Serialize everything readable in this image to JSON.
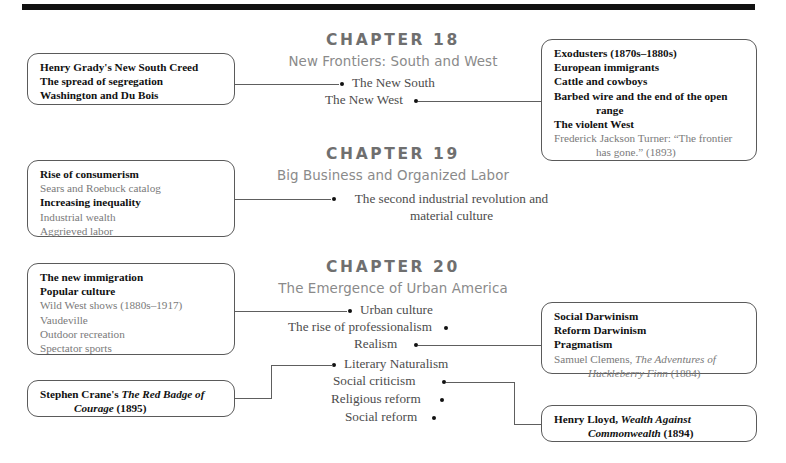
{
  "page": {
    "rule_color": "#111111",
    "box_border_color": "#5a5a5a",
    "heading_color": "#6f6f6f",
    "subheading_color": "#8a8a8a",
    "body_color": "#4c4c4c",
    "muted_color": "#7a7a7a"
  },
  "chapters": [
    {
      "number": "CHAPTER 18",
      "title": "New Frontiers: South and West",
      "topics": [
        {
          "label": "The New South"
        },
        {
          "label": "The New West"
        }
      ]
    },
    {
      "number": "CHAPTER 19",
      "title": "Big Business and Organized Labor",
      "topics": [
        {
          "label": "The second industrial revolution and material culture"
        }
      ]
    },
    {
      "number": "CHAPTER 20",
      "title": "The Emergence of Urban America",
      "topics": [
        {
          "label": "Urban culture"
        },
        {
          "label": "The rise of professionalism"
        },
        {
          "label": "Realism"
        },
        {
          "label": "Literary Naturalism"
        },
        {
          "label": "Social criticism"
        },
        {
          "label": "Religious reform"
        },
        {
          "label": "Social reform"
        }
      ]
    }
  ],
  "boxes": {
    "grady": {
      "lines": [
        "Henry Grady's New South Creed",
        "The spread of segregation",
        "Washington and Du Bois"
      ]
    },
    "exodusters": {
      "l1": "Exodusters (1870s–1880s)",
      "l2": "European immigrants",
      "l3": "Cattle and cowboys",
      "l4": "Barbed wire and the end of the open",
      "l5": "range",
      "l6": "The violent West",
      "l7": "Frederick Jackson Turner: “The frontier",
      "l8": "has gone.” (1893)"
    },
    "consumerism": {
      "l1": "Rise of consumerism",
      "l2": "Sears and Roebuck catalog",
      "l3": "Increasing inequality",
      "l4": "Industrial wealth",
      "l5": "Aggrieved labor"
    },
    "immigration": {
      "l1": "The new immigration",
      "l2": "Popular culture",
      "l3": "Wild West shows (1880s–1917)",
      "l4": "Vaudeville",
      "l5": "Outdoor recreation",
      "l6": "Spectator sports"
    },
    "darwinism": {
      "l1": "Social Darwinism",
      "l2": "Reform Darwinism",
      "l3": "Pragmatism",
      "l4a": "Samuel Clemens, ",
      "l4b": "The Adventures of",
      "l5a": "Huckleberry Finn",
      "l5b": " (1884)"
    },
    "crane": {
      "l1a": "Stephen Crane's ",
      "l1b": "The Red Badge of",
      "l2a": "Courage",
      "l2b": " (1895)"
    },
    "lloyd": {
      "l1a": "Henry Lloyd, ",
      "l1b": "Wealth Against",
      "l2a": "Commonwealth",
      "l2b": " (1894)"
    }
  }
}
